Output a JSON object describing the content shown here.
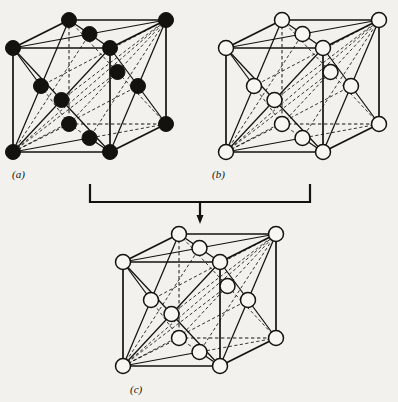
{
  "figure": {
    "background_color": "#f2f1ed",
    "ink_color": "#14120f",
    "filled_atom_color": "#14120f",
    "open_atom_fill": "#f7f6f2",
    "atom_outline_color": "#14120f",
    "atom_radius": 7.5,
    "solid_edge_style": "solid",
    "hidden_edge_style": "dashed"
  },
  "panels": [
    {
      "id": "a",
      "label": "(a)",
      "label_x": 12,
      "label_y": 178,
      "origin_x": 13,
      "origin_y": 48,
      "cube_width": 97,
      "cube_height": 104,
      "depth_dx": 56,
      "depth_dy": -28,
      "description": "face-centred cubic lattice of filled atoms",
      "corner_style": "filled",
      "face_style": "filled",
      "edge_style": "filled"
    },
    {
      "id": "b",
      "label": "(b)",
      "label_x": 212,
      "label_y": 178,
      "origin_x": 226,
      "origin_y": 48,
      "cube_width": 97,
      "cube_height": 104,
      "depth_dx": 56,
      "depth_dy": -28,
      "description": "face-centred cubic lattice of open atoms",
      "corner_style": "open",
      "face_style": "open",
      "edge_style": "open"
    },
    {
      "id": "c",
      "label": "(c)",
      "label_x": 130,
      "label_y": 393,
      "origin_x": 123,
      "origin_y": 262,
      "cube_width": 97,
      "cube_height": 104,
      "depth_dx": 56,
      "depth_dy": -28,
      "description": "combined rock-salt structure with alternating filled and open atoms",
      "corner_style": "alternating",
      "face_style": "alternating",
      "edge_style": "alternating"
    }
  ],
  "connector": {
    "name": "combination-bracket-arrow",
    "left_x": 90,
    "right_x": 310,
    "top_y": 184,
    "bar_y": 202,
    "arrow_x": 200,
    "arrow_tip_y": 224,
    "arrow_head_width": 7,
    "arrow_head_height": 9,
    "stroke_width": 2.2
  },
  "lattice_geometry": {
    "type": "face-centred cubic",
    "corner_sites": 8,
    "face_centre_sites": 6,
    "edge_centre_sites_shown": 0,
    "corners": [
      {
        "name": "front-bottom-left",
        "u": 0,
        "v": 0,
        "w": 0
      },
      {
        "name": "front-bottom-right",
        "u": 1,
        "v": 0,
        "w": 0
      },
      {
        "name": "front-top-left",
        "u": 0,
        "v": 1,
        "w": 0
      },
      {
        "name": "front-top-right",
        "u": 1,
        "v": 1,
        "w": 0
      },
      {
        "name": "back-bottom-left",
        "u": 0,
        "v": 0,
        "w": 1
      },
      {
        "name": "back-bottom-right",
        "u": 1,
        "v": 0,
        "w": 1
      },
      {
        "name": "back-top-left",
        "u": 0,
        "v": 1,
        "w": 1
      },
      {
        "name": "back-top-right",
        "u": 1,
        "v": 1,
        "w": 1
      }
    ],
    "face_centres": [
      {
        "name": "front-face-centre",
        "u": 0.5,
        "v": 0.5,
        "w": 0
      },
      {
        "name": "back-face-centre",
        "u": 0.5,
        "v": 0.5,
        "w": 1
      },
      {
        "name": "left-face-centre",
        "u": 0,
        "v": 0.5,
        "w": 0.5
      },
      {
        "name": "right-face-centre",
        "u": 1,
        "v": 0.5,
        "w": 0.5
      },
      {
        "name": "bottom-face-centre",
        "u": 0.5,
        "v": 0,
        "w": 0.5
      },
      {
        "name": "top-face-centre",
        "u": 0.5,
        "v": 1,
        "w": 0.5
      }
    ],
    "cube_edges": [
      {
        "from": "front-bottom-left",
        "to": "front-bottom-right",
        "hidden": false
      },
      {
        "from": "front-bottom-right",
        "to": "front-top-right",
        "hidden": false
      },
      {
        "from": "front-top-right",
        "to": "front-top-left",
        "hidden": false
      },
      {
        "from": "front-top-left",
        "to": "front-bottom-left",
        "hidden": false
      },
      {
        "from": "back-bottom-left",
        "to": "back-bottom-right",
        "hidden": true
      },
      {
        "from": "back-bottom-right",
        "to": "back-top-right",
        "hidden": false
      },
      {
        "from": "back-top-right",
        "to": "back-top-left",
        "hidden": false
      },
      {
        "from": "back-top-left",
        "to": "back-bottom-left",
        "hidden": true
      },
      {
        "from": "front-bottom-left",
        "to": "back-bottom-left",
        "hidden": true
      },
      {
        "from": "front-bottom-right",
        "to": "back-bottom-right",
        "hidden": false
      },
      {
        "from": "front-top-left",
        "to": "back-top-left",
        "hidden": false
      },
      {
        "from": "front-top-right",
        "to": "back-top-right",
        "hidden": false
      }
    ],
    "bonds": [
      {
        "from": "front-bottom-left",
        "to": "front-face-centre",
        "hidden": false
      },
      {
        "from": "front-bottom-right",
        "to": "front-face-centre",
        "hidden": false
      },
      {
        "from": "front-top-left",
        "to": "front-face-centre",
        "hidden": false
      },
      {
        "from": "front-top-right",
        "to": "front-face-centre",
        "hidden": false
      },
      {
        "from": "back-bottom-left",
        "to": "back-face-centre",
        "hidden": true
      },
      {
        "from": "back-bottom-right",
        "to": "back-face-centre",
        "hidden": true
      },
      {
        "from": "back-top-left",
        "to": "back-face-centre",
        "hidden": true
      },
      {
        "from": "back-top-right",
        "to": "back-face-centre",
        "hidden": true
      },
      {
        "from": "front-bottom-left",
        "to": "left-face-centre",
        "hidden": false
      },
      {
        "from": "front-top-left",
        "to": "left-face-centre",
        "hidden": false
      },
      {
        "from": "back-bottom-left",
        "to": "left-face-centre",
        "hidden": true
      },
      {
        "from": "back-top-left",
        "to": "left-face-centre",
        "hidden": false
      },
      {
        "from": "front-bottom-right",
        "to": "right-face-centre",
        "hidden": false
      },
      {
        "from": "front-top-right",
        "to": "right-face-centre",
        "hidden": false
      },
      {
        "from": "back-bottom-right",
        "to": "right-face-centre",
        "hidden": false
      },
      {
        "from": "back-top-right",
        "to": "right-face-centre",
        "hidden": false
      },
      {
        "from": "front-bottom-left",
        "to": "bottom-face-centre",
        "hidden": false
      },
      {
        "from": "front-bottom-right",
        "to": "bottom-face-centre",
        "hidden": false
      },
      {
        "from": "back-bottom-left",
        "to": "bottom-face-centre",
        "hidden": true
      },
      {
        "from": "back-bottom-right",
        "to": "bottom-face-centre",
        "hidden": true
      },
      {
        "from": "front-top-left",
        "to": "top-face-centre",
        "hidden": false
      },
      {
        "from": "front-top-right",
        "to": "top-face-centre",
        "hidden": false
      },
      {
        "from": "back-top-left",
        "to": "top-face-centre",
        "hidden": false
      },
      {
        "from": "back-top-right",
        "to": "top-face-centre",
        "hidden": false
      },
      {
        "from": "front-bottom-left",
        "to": "back-top-right",
        "hidden": true
      },
      {
        "from": "front-bottom-left",
        "to": "right-face-centre",
        "hidden": true
      },
      {
        "from": "front-bottom-left",
        "to": "top-face-centre",
        "hidden": true
      },
      {
        "from": "front-bottom-left",
        "to": "back-face-centre",
        "hidden": true
      },
      {
        "from": "back-top-right",
        "to": "front-face-centre",
        "hidden": true
      },
      {
        "from": "back-top-right",
        "to": "left-face-centre",
        "hidden": true
      },
      {
        "from": "back-top-right",
        "to": "bottom-face-centre",
        "hidden": true
      }
    ]
  },
  "ghost_text_lines": [
    {
      "text": "",
      "x": 0,
      "y": 0
    }
  ]
}
